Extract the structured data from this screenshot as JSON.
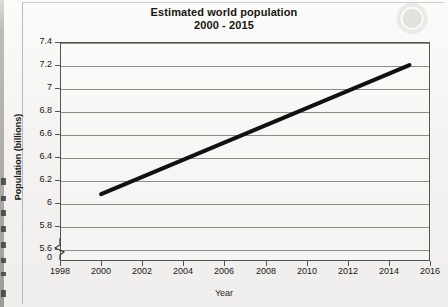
{
  "chart_data": {
    "type": "line",
    "title": "Estimated world population\n2000 - 2015",
    "title_line1": "Estimated world population",
    "title_line2": "2000 - 2015",
    "xlabel": "Year",
    "ylabel": "Population (billions)",
    "x": [
      2000,
      2015
    ],
    "values": [
      6.08,
      7.2
    ],
    "series": [
      {
        "name": "Estimated world population",
        "x": [
          2000,
          2015
        ],
        "values": [
          6.08,
          7.2
        ]
      }
    ],
    "xlim": [
      1998,
      2016
    ],
    "ylim": [
      5.5,
      7.4
    ],
    "xticks": [
      1998,
      2000,
      2002,
      2004,
      2006,
      2008,
      2010,
      2012,
      2014,
      2016
    ],
    "xtick_labels": [
      "1998",
      "2000",
      "2002",
      "2004",
      "2006",
      "2008",
      "2010",
      "2012",
      "2014",
      "2016"
    ],
    "yticks": [
      5.6,
      5.8,
      6.0,
      6.2,
      6.4,
      6.6,
      6.8,
      7.0,
      7.2,
      7.4
    ],
    "ytick_labels": [
      "5.6",
      "5.8",
      "6",
      "6.2",
      "6.4",
      "6.6",
      "6.8",
      "7",
      "7.2",
      "7.4"
    ],
    "y_axis_break": true,
    "y_origin_label": "0",
    "grid": "horizontal",
    "legend": "none",
    "line_color": "#111111",
    "line_width_px": 4
  },
  "colors": {
    "paper": "#f4f3f1",
    "ink": "#18180f",
    "axis": "#55554f",
    "gridline": "#6e6e68",
    "line": "#111111"
  }
}
